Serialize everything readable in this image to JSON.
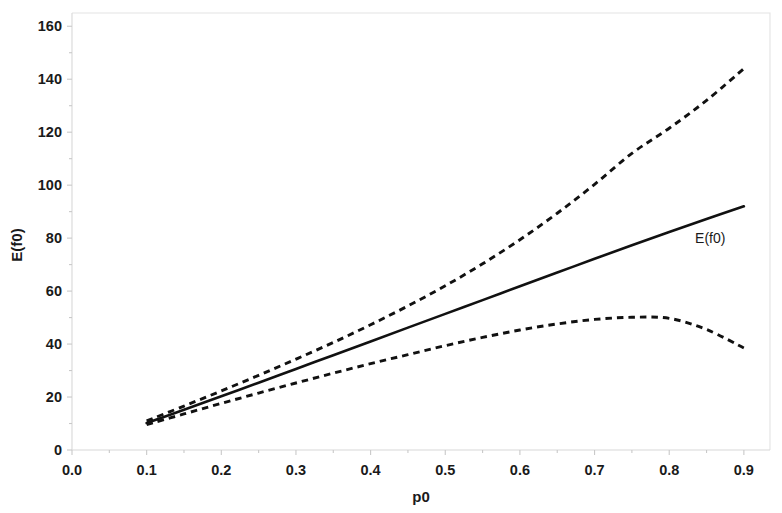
{
  "chart_data": {
    "type": "line",
    "title": "",
    "subtitle": "",
    "xlabel": "p0",
    "ylabel": "E(f0)",
    "xlim": [
      0.0,
      0.935
    ],
    "ylim": [
      0,
      165
    ],
    "grid": false,
    "legend_position": "inline-annotation",
    "x_ticks": [
      0.0,
      0.1,
      0.2,
      0.3,
      0.4,
      0.5,
      0.6,
      0.7,
      0.8,
      0.9
    ],
    "x_tick_labels": [
      "0.0",
      "0.1",
      "0.2",
      "0.3",
      "0.4",
      "0.5",
      "0.6",
      "0.7",
      "0.8",
      "0.9"
    ],
    "y_ticks": [
      0,
      20,
      40,
      60,
      80,
      100,
      120,
      140,
      160
    ],
    "y_tick_labels": [
      "0",
      "20",
      "40",
      "60",
      "80",
      "100",
      "120",
      "140",
      "160"
    ],
    "annotations": [
      {
        "text": "E(f0)",
        "x": 0.855,
        "y": 78,
        "series": "expected"
      }
    ],
    "series": [
      {
        "name": "E(f0)",
        "style": "solid",
        "color": "#111111",
        "x": [
          0.1,
          0.15,
          0.2,
          0.25,
          0.3,
          0.35,
          0.4,
          0.45,
          0.5,
          0.55,
          0.6,
          0.65,
          0.7,
          0.75,
          0.8,
          0.85,
          0.9
        ],
        "values": [
          10.2,
          15.2,
          20.3,
          25.4,
          30.6,
          35.8,
          41.0,
          46.2,
          51.4,
          56.6,
          61.8,
          67.0,
          72.2,
          77.3,
          82.3,
          87.2,
          92.0
        ]
      },
      {
        "name": "upper-bound",
        "style": "dashed",
        "color": "#111111",
        "x": [
          0.1,
          0.15,
          0.2,
          0.25,
          0.3,
          0.35,
          0.4,
          0.45,
          0.5,
          0.55,
          0.6,
          0.65,
          0.7,
          0.75,
          0.8,
          0.85,
          0.9
        ],
        "values": [
          11.0,
          16.6,
          22.3,
          28.2,
          34.3,
          40.6,
          47.3,
          54.4,
          62.0,
          70.3,
          79.4,
          89.4,
          100.3,
          112.0,
          121.5,
          132.0,
          144.0
        ]
      },
      {
        "name": "lower-bound",
        "style": "dashed",
        "color": "#111111",
        "x": [
          0.1,
          0.15,
          0.2,
          0.25,
          0.3,
          0.35,
          0.4,
          0.45,
          0.5,
          0.55,
          0.6,
          0.65,
          0.7,
          0.75,
          0.8,
          0.85,
          0.9
        ],
        "values": [
          9.6,
          13.6,
          17.6,
          21.5,
          25.3,
          29.0,
          32.6,
          36.0,
          39.4,
          42.5,
          45.3,
          47.6,
          49.3,
          50.1,
          49.7,
          45.5,
          38.5
        ]
      }
    ]
  }
}
